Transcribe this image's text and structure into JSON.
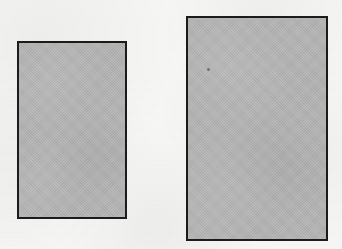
{
  "figure": {
    "background_color": "#f7f7f6",
    "canvas_width": 342,
    "canvas_height": 249,
    "medium": "scanned grayscale line art"
  },
  "style": {
    "fill_color": "#b5b5b5",
    "border_color": "#1b1b1b",
    "border_width_px": 2
  },
  "shapes": [
    {
      "id": "rectangle-left",
      "label": "Left rectangle",
      "x": 17,
      "y": 41,
      "width": 110,
      "height": 178,
      "fill_color": "#b5b5b5",
      "border_color": "#1b1b1b",
      "border_width_px": 2
    },
    {
      "id": "rectangle-right",
      "label": "Right rectangle",
      "x": 186,
      "y": 16,
      "width": 142,
      "height": 225,
      "fill_color": "#b5b5b5",
      "border_color": "#1b1b1b",
      "border_width_px": 2
    }
  ],
  "artifacts": [
    {
      "id": "scan-speck",
      "label": "scan speck",
      "x": 207,
      "y": 68,
      "size": 3
    }
  ]
}
